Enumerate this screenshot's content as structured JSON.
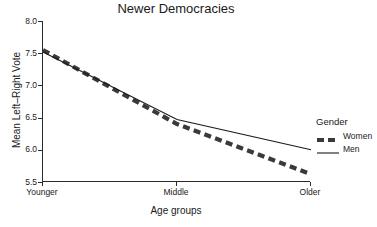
{
  "chart_data": {
    "type": "line",
    "title": "Newer Democracies",
    "xlabel": "Age groups",
    "ylabel": "Mean Left–Right Vote",
    "categories": [
      "Younger",
      "Middle",
      "Older"
    ],
    "ylim": [
      5.5,
      8.0
    ],
    "yticks": [
      "5.5",
      "6.0",
      "6.5",
      "7.0",
      "7.5",
      "8.0"
    ],
    "ytick_values": [
      5.5,
      6.0,
      6.5,
      7.0,
      7.5,
      8.0
    ],
    "grid": false,
    "legend_position": "right",
    "series": [
      {
        "name": "Women",
        "values": [
          7.55,
          6.4,
          5.62
        ],
        "style": "dashed",
        "color": "#3a3a3a",
        "width": 4.2
      },
      {
        "name": "Men",
        "values": [
          7.52,
          6.47,
          6.0
        ],
        "style": "solid",
        "color": "#1a1a1a",
        "width": 1.1
      }
    ]
  },
  "legend": {
    "title": "Gender",
    "entries": [
      {
        "label": "Women"
      },
      {
        "label": "Men"
      }
    ]
  }
}
